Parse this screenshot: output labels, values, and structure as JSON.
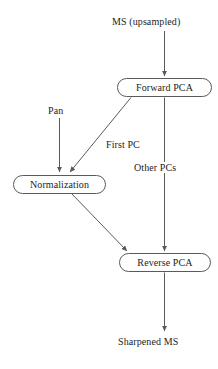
{
  "diagram": {
    "stroke_color": "#5a5a5a",
    "text_color": "#1d1d1d",
    "background_color": "#ffffff",
    "nodes": [
      {
        "id": "forward_pca",
        "label": "Forward PCA",
        "shape": "rounded-rect"
      },
      {
        "id": "normalization",
        "label": "Normalization",
        "shape": "rounded-rect"
      },
      {
        "id": "reverse_pca",
        "label": "Reverse PCA",
        "shape": "rounded-rect"
      }
    ],
    "terminals": [
      {
        "id": "ms_upsampled",
        "label": "MS (upsampled)"
      },
      {
        "id": "pan",
        "label": "Pan"
      },
      {
        "id": "sharpened_ms",
        "label": "Sharpened MS"
      }
    ],
    "edge_labels": [
      {
        "id": "first_pc",
        "label": "First PC"
      },
      {
        "id": "other_pcs",
        "label": "Other PCs"
      }
    ],
    "edges": [
      {
        "from": "ms_upsampled",
        "to": "forward_pca",
        "label": "",
        "style": "straight-vertical"
      },
      {
        "from": "forward_pca",
        "to": "normalization",
        "label": "First PC",
        "style": "diagonal"
      },
      {
        "from": "pan",
        "to": "normalization",
        "label": "",
        "style": "straight-vertical"
      },
      {
        "from": "forward_pca",
        "to": "reverse_pca",
        "label": "Other PCs",
        "style": "straight-vertical"
      },
      {
        "from": "normalization",
        "to": "reverse_pca",
        "label": "",
        "style": "diagonal"
      },
      {
        "from": "reverse_pca",
        "to": "sharpened_ms",
        "label": "",
        "style": "straight-vertical"
      }
    ]
  }
}
